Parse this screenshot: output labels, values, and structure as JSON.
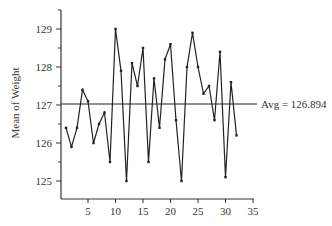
{
  "chart_data": {
    "type": "line",
    "title": "",
    "xlabel": "",
    "ylabel": "Mean of Weight",
    "x": [
      1,
      2,
      3,
      4,
      5,
      6,
      7,
      8,
      9,
      10,
      11,
      12,
      13,
      14,
      15,
      16,
      17,
      18,
      19,
      20,
      21,
      22,
      23,
      24,
      25,
      26,
      27,
      28,
      29,
      30,
      31,
      32
    ],
    "series": [
      {
        "name": "Mean of Weight",
        "values": [
          126.4,
          125.9,
          126.4,
          127.4,
          127.1,
          126.0,
          126.5,
          126.8,
          125.5,
          129.0,
          127.9,
          125.0,
          128.1,
          127.5,
          128.5,
          125.5,
          127.7,
          126.4,
          128.2,
          128.6,
          126.6,
          125.0,
          128.0,
          128.9,
          128.0,
          127.3,
          127.5,
          126.6,
          128.4,
          125.1,
          127.6,
          126.2
        ]
      }
    ],
    "reference_line": {
      "value": 126.894,
      "label": "Avg = 126.894",
      "display_value": 127.0
    },
    "x_ticks": [
      5,
      10,
      15,
      20,
      25,
      30,
      35
    ],
    "x_tick_labels": [
      "5",
      "10",
      "15",
      "20",
      "25",
      "30",
      "35"
    ],
    "y_ticks": [
      125,
      126,
      127,
      128,
      129
    ],
    "y_tick_labels": [
      "125",
      "126",
      "127",
      "128",
      "129"
    ],
    "y_minor_ticks": [
      124.5,
      125.5,
      126.5,
      127.5,
      128.5,
      129.5
    ],
    "xlim": [
      0,
      35
    ],
    "ylim": [
      124.5,
      129.5
    ],
    "grid": false,
    "legend": "none"
  },
  "labels": {
    "y_axis": "Mean of Weight",
    "avg": "Avg = 126.894"
  },
  "colors": {
    "line": "#222222",
    "axis": "#333333",
    "text": "#333333"
  }
}
